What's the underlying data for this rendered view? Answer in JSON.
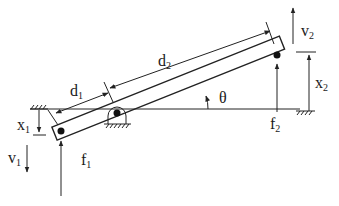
{
  "diagram": {
    "type": "lever mechanism free-body diagram",
    "labels": {
      "d1": {
        "base": "d",
        "sub": "1"
      },
      "d2": {
        "base": "d",
        "sub": "2"
      },
      "theta": {
        "base": "θ"
      },
      "x1": {
        "base": "x",
        "sub": "1"
      },
      "x2": {
        "base": "x",
        "sub": "2"
      },
      "v1": {
        "base": "v",
        "sub": "1"
      },
      "v2": {
        "base": "v",
        "sub": "2"
      },
      "f1": {
        "base": "f",
        "sub": "1"
      },
      "f2": {
        "base": "f",
        "sub": "2"
      }
    },
    "elements": [
      "inclined bar with end masses",
      "pivot support with ground hatching",
      "horizontal reference line",
      "ground hatch marks at left and right",
      "force arrows f1 and f2 (upward)",
      "velocity arrows v1 (down) and v2 (up)",
      "displacement indicators x1 and x2",
      "length dimension arrows d1 and d2",
      "angle arc theta"
    ]
  }
}
